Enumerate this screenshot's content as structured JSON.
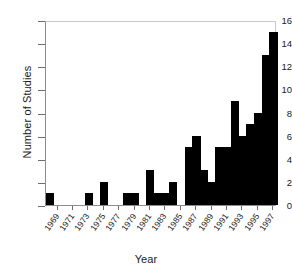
{
  "chart_data": {
    "type": "bar",
    "title": "",
    "xlabel": "Year",
    "ylabel": "Number of Studies",
    "categories": [
      1968,
      1969,
      1970,
      1971,
      1972,
      1973,
      1974,
      1975,
      1976,
      1977,
      1978,
      1979,
      1980,
      1981,
      1982,
      1983,
      1984,
      1985,
      1986,
      1987,
      1988,
      1989,
      1990,
      1991,
      1992,
      1993,
      1994,
      1995,
      1996,
      1997
    ],
    "values": [
      1,
      0,
      0,
      0,
      0,
      1,
      0,
      2,
      0,
      0,
      1,
      1,
      0,
      3,
      1,
      1,
      2,
      0,
      5,
      6,
      3,
      2,
      5,
      5,
      9,
      6,
      7,
      8,
      13,
      15
    ],
    "xlim": [
      1967.5,
      1997.5
    ],
    "ylim": [
      0,
      16
    ],
    "ytick_values": [
      0,
      2,
      4,
      6,
      8,
      10,
      12,
      14,
      16
    ],
    "ytick_labels": [
      "0",
      "2",
      "4",
      "6",
      "8",
      "10",
      "12",
      "14",
      "16"
    ],
    "xtick_values": [
      1969,
      1971,
      1973,
      1975,
      1977,
      1979,
      1981,
      1983,
      1985,
      1987,
      1989,
      1991,
      1993,
      1995,
      1997
    ],
    "xtick_labels": [
      "1969",
      "1971",
      "1973",
      "1975",
      "1977",
      "1979",
      "1981",
      "1983",
      "1985",
      "1987",
      "1989",
      "1991",
      "1993",
      "1995",
      "1997"
    ],
    "grid": false,
    "legend": null,
    "bar_color": "#000000",
    "axis_color": "#8c8c8c",
    "background_color": "#ffffff"
  }
}
